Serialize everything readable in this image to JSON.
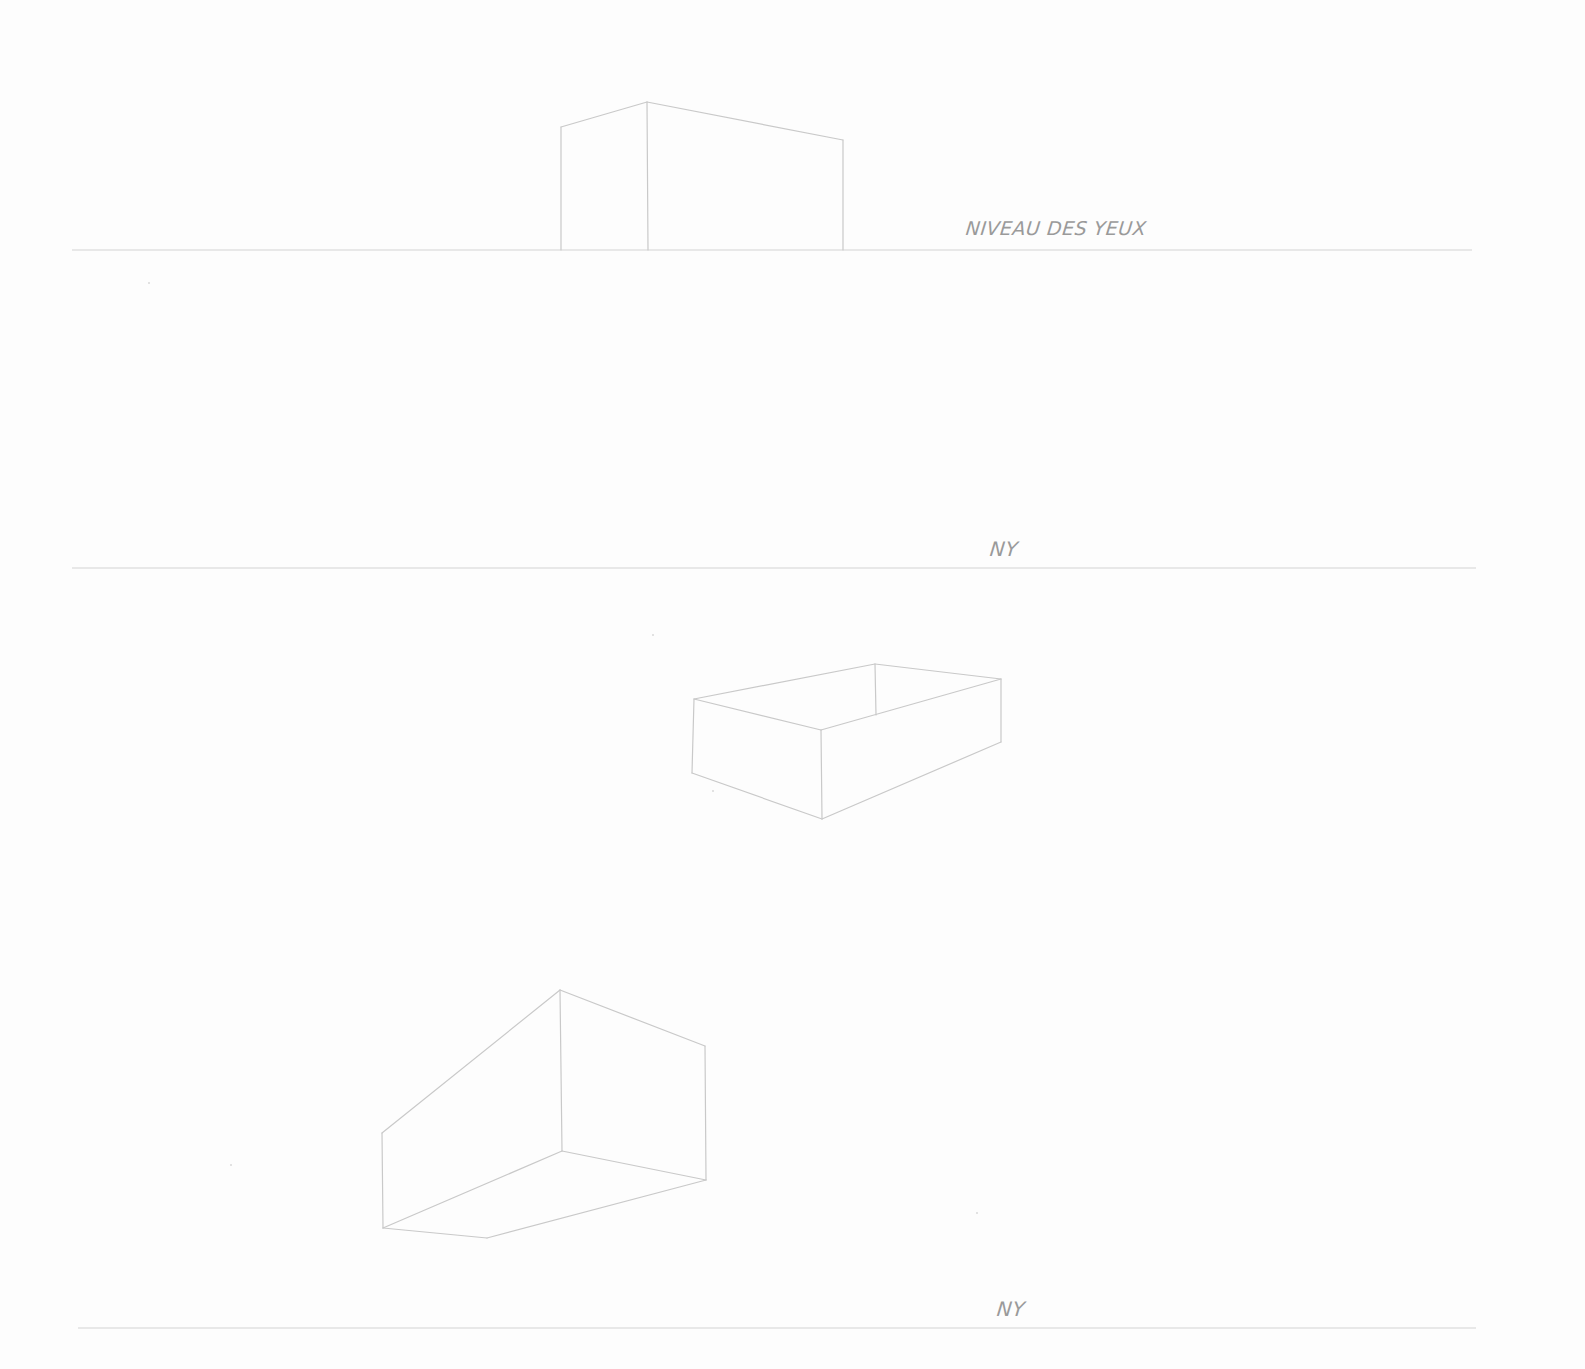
{
  "sheet": {
    "background": "#fdfdfd",
    "stroke_color": "#c9c9c9",
    "label_color": "#9a9a9a"
  },
  "eye_level_lines": [
    {
      "id": "eye-level-1",
      "y": 250,
      "x1": 72,
      "x2": 1472,
      "label": "NIVEAU DES YEUX",
      "label_x": 966,
      "label_y": 217
    },
    {
      "id": "eye-level-2",
      "y": 568,
      "x1": 72,
      "x2": 1476,
      "label": "NY",
      "label_x": 990,
      "label_y": 537
    },
    {
      "id": "eye-level-3",
      "y": 1328,
      "x1": 78,
      "x2": 1476,
      "label": "NY",
      "label_x": 997,
      "label_y": 1297
    }
  ],
  "boxes": [
    {
      "id": "box-above-eye-level",
      "description": "Two-point perspective box sitting on eye level, top visible from below",
      "edges": [
        [
          [
            561,
            127
          ],
          [
            647,
            102
          ]
        ],
        [
          [
            647,
            102
          ],
          [
            843,
            140
          ]
        ],
        [
          [
            561,
            127
          ],
          [
            561,
            250
          ]
        ],
        [
          [
            647,
            102
          ],
          [
            648,
            250
          ]
        ],
        [
          [
            843,
            140
          ],
          [
            843,
            250
          ]
        ]
      ]
    },
    {
      "id": "box-below-eye-level",
      "description": "Open-top box seen from above, between eye levels",
      "edges": [
        [
          [
            694,
            699
          ],
          [
            875,
            664
          ]
        ],
        [
          [
            875,
            664
          ],
          [
            1001,
            679
          ]
        ],
        [
          [
            694,
            699
          ],
          [
            821,
            730
          ]
        ],
        [
          [
            821,
            730
          ],
          [
            1001,
            679
          ]
        ],
        [
          [
            875,
            664
          ],
          [
            876,
            715
          ]
        ],
        [
          [
            694,
            699
          ],
          [
            692,
            773
          ]
        ],
        [
          [
            821,
            730
          ],
          [
            822,
            819
          ]
        ],
        [
          [
            1001,
            679
          ],
          [
            1001,
            742
          ]
        ],
        [
          [
            692,
            773
          ],
          [
            822,
            819
          ]
        ],
        [
          [
            822,
            819
          ],
          [
            1001,
            742
          ]
        ]
      ]
    },
    {
      "id": "box-floating-above",
      "description": "Box seen from below, bottom face visible",
      "edges": [
        [
          [
            382,
            1133
          ],
          [
            560,
            990
          ]
        ],
        [
          [
            560,
            990
          ],
          [
            705,
            1046
          ]
        ],
        [
          [
            382,
            1133
          ],
          [
            383,
            1228
          ]
        ],
        [
          [
            560,
            990
          ],
          [
            562,
            1151
          ]
        ],
        [
          [
            705,
            1046
          ],
          [
            706,
            1180
          ]
        ],
        [
          [
            383,
            1228
          ],
          [
            562,
            1151
          ]
        ],
        [
          [
            562,
            1151
          ],
          [
            706,
            1180
          ]
        ],
        [
          [
            383,
            1228
          ],
          [
            487,
            1238
          ]
        ],
        [
          [
            487,
            1238
          ],
          [
            706,
            1180
          ]
        ]
      ]
    }
  ],
  "specks": [
    {
      "x": 148,
      "y": 282
    },
    {
      "x": 652,
      "y": 634
    },
    {
      "x": 230,
      "y": 1164
    },
    {
      "x": 976,
      "y": 1212
    },
    {
      "x": 712,
      "y": 790
    }
  ]
}
